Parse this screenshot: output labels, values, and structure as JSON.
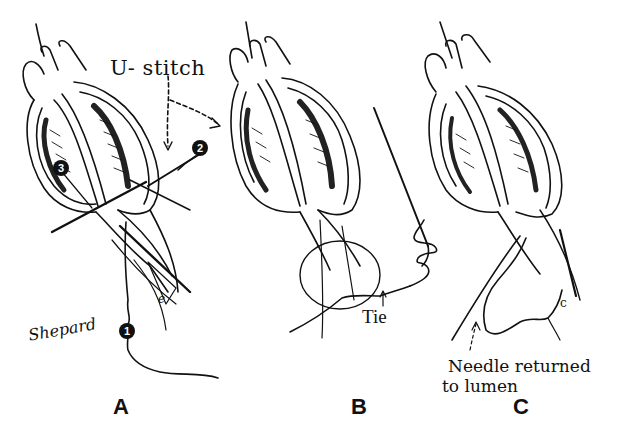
{
  "figure": {
    "panels": [
      {
        "id": "A",
        "label": "A"
      },
      {
        "id": "B",
        "label": "B"
      },
      {
        "id": "C",
        "label": "C"
      }
    ],
    "annotations": {
      "u_stitch": "U- stitch",
      "tie": "Tie",
      "needle_returned_line1": "Needle returned",
      "needle_returned_line2": "to lumen"
    },
    "markers": [
      "1",
      "2",
      "3"
    ],
    "small_letters": {
      "panel_a": "e",
      "panel_c": "c"
    },
    "signature": "Shepard"
  },
  "colors": {
    "ink": "#111111",
    "paper": "#ffffff"
  }
}
